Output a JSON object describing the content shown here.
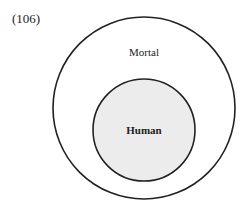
{
  "example_number": "(106)",
  "diagram": {
    "type": "euler",
    "outer_set": {
      "label": "Mortal",
      "fill": "#ffffff",
      "stroke": "#222222"
    },
    "inner_set": {
      "label": "Human",
      "fill": "#ececec",
      "stroke": "#222222"
    }
  }
}
